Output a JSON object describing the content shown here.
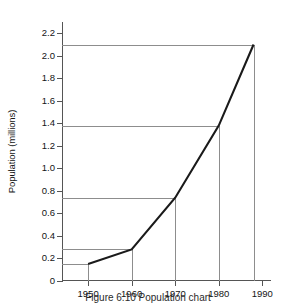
{
  "chart_data": {
    "type": "line",
    "title": "",
    "xlabel": "",
    "ylabel": "Population (millions)",
    "xlim": [
      1944,
      1992
    ],
    "ylim": [
      0,
      2.3
    ],
    "grid": false,
    "legend": null,
    "x": [
      1950,
      1960,
      1970,
      1980,
      1988
    ],
    "values": [
      0.15,
      0.28,
      0.74,
      1.38,
      2.1
    ],
    "series": [
      {
        "name": "Population",
        "x": [
          1950,
          1960,
          1970,
          1980,
          1988
        ],
        "values": [
          0.15,
          0.28,
          0.74,
          1.38,
          2.1
        ]
      }
    ],
    "xticks": [
      1950,
      1960,
      1970,
      1980,
      1990
    ],
    "xtick_labels": [
      "1950",
      "1960",
      "1970",
      "1980",
      "1990"
    ],
    "yticks": [
      0,
      0.2,
      0.4,
      0.6,
      0.8,
      1.0,
      1.2,
      1.4,
      1.6,
      1.8,
      2.0,
      2.2
    ],
    "ytick_labels": [
      "0",
      "0.2",
      "0.4",
      "0.6",
      "0.8",
      "1.0",
      "1.2",
      "1.4",
      "1.6",
      "1.8",
      "2.0",
      "2.2"
    ],
    "annotations": {
      "leader_lines": "Each data point has a horizontal leader line to the y-axis and a vertical drop line to the x-axis.",
      "leader_values": [
        0.15,
        0.28,
        0.74,
        1.38,
        2.1
      ]
    },
    "colors": {
      "series_line": "#1a1a1a",
      "leader_line": "#8d8d8d",
      "axis": "#555555",
      "background": "#ffffff"
    }
  },
  "caption": {
    "text": "Figure 6.10 Population chart",
    "visible": "partially-clipped"
  }
}
